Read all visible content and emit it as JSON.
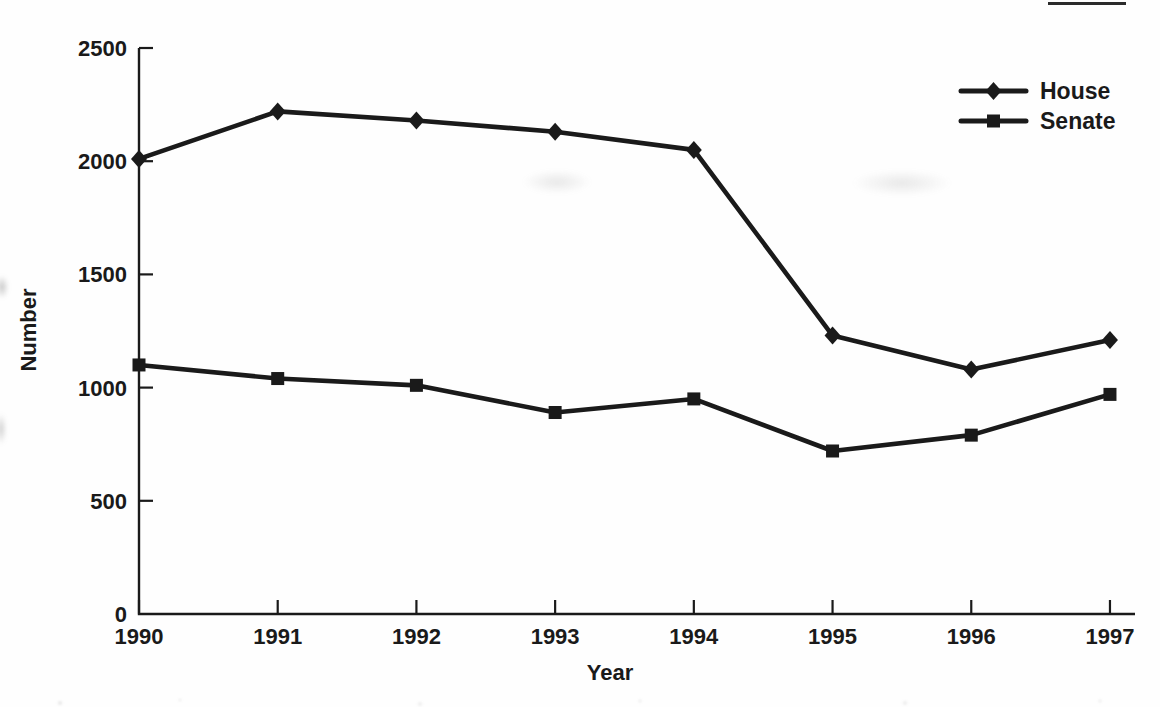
{
  "colors": {
    "ink": "#1a1a1a",
    "background": "#fefefe"
  },
  "chart_data": {
    "type": "line",
    "title": "",
    "xlabel": "Year",
    "ylabel": "Number",
    "categories": [
      "1990",
      "1991",
      "1992",
      "1993",
      "1994",
      "1995",
      "1996",
      "1997"
    ],
    "series": [
      {
        "name": "House",
        "marker": "diamond",
        "values": [
          2010,
          2220,
          2180,
          2130,
          2050,
          1230,
          1080,
          1210
        ]
      },
      {
        "name": "Senate",
        "marker": "square",
        "values": [
          1100,
          1040,
          1010,
          890,
          950,
          720,
          790,
          970
        ]
      }
    ],
    "ylim": [
      0,
      2500
    ],
    "yticks": [
      0,
      500,
      1000,
      1500,
      2000,
      2500
    ],
    "ytick_labels": [
      "0",
      "500",
      "1000",
      "1500",
      "2000",
      "2500"
    ],
    "grid": false,
    "legend_position": "top-right",
    "legend_entries": [
      "House",
      "Senate"
    ]
  }
}
